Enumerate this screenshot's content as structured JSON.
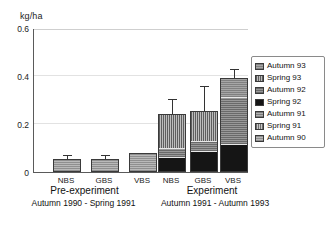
{
  "axis": {
    "y_unit": "kg/ha",
    "y_ticks": [
      "0.6",
      "0.4",
      "0.2",
      "0"
    ]
  },
  "groups": [
    {
      "name": "Pre-experiment",
      "title": "Pre-experiment",
      "subtitle": "Autumn 1990 - Spring 1991",
      "ticks": [
        "NBS",
        "GBS",
        "VBS"
      ]
    },
    {
      "name": "Experiment",
      "title": "Experiment",
      "subtitle": "Autumn 1991 - Autumn 1993",
      "ticks": [
        "NBS",
        "GBS",
        "VBS"
      ]
    }
  ],
  "legend": {
    "items": [
      {
        "label": "Autumn 93",
        "key": "a93",
        "swatch": "p-a93"
      },
      {
        "label": "Spring 93",
        "key": "s93",
        "swatch": "p-s93"
      },
      {
        "label": "Autumn 92",
        "key": "a92",
        "swatch": "p-a92"
      },
      {
        "label": "Spring 92",
        "key": "s92",
        "swatch": "p-s92"
      },
      {
        "label": "Autumn 91",
        "key": "a91",
        "swatch": "p-a91"
      },
      {
        "label": "Spring 91",
        "key": "s91",
        "swatch": "p-s91"
      },
      {
        "label": "Autumn 90",
        "key": "a90",
        "swatch": "p-a90"
      }
    ]
  },
  "chart_data": {
    "type": "bar",
    "stacked": true,
    "title": "",
    "xlabel": "",
    "ylabel": "kg/ha",
    "ylim": [
      0,
      0.6
    ],
    "yticks": [
      0,
      0.2,
      0.4,
      0.6
    ],
    "grid": "horizontal",
    "legend_position": "right",
    "categories": [
      "Pre-experiment NBS",
      "Pre-experiment GBS",
      "Pre-experiment VBS",
      "Experiment NBS",
      "Experiment GBS",
      "Experiment VBS"
    ],
    "series": [
      {
        "name": "Autumn 90",
        "values": [
          0.055,
          0.055,
          0.08,
          0,
          0,
          0
        ]
      },
      {
        "name": "Spring 91",
        "values": [
          0,
          0,
          0,
          0,
          0,
          0
        ]
      },
      {
        "name": "Autumn 91",
        "values": [
          0,
          0,
          0,
          0,
          0,
          0
        ]
      },
      {
        "name": "Spring 92",
        "values": [
          0,
          0,
          0,
          0.055,
          0.08,
          0.11
        ]
      },
      {
        "name": "Autumn 92",
        "values": [
          0,
          0,
          0,
          0.04,
          0.045,
          0.2
        ]
      },
      {
        "name": "Spring 93",
        "values": [
          0,
          0,
          0,
          0.145,
          0.13,
          0.0
        ]
      },
      {
        "name": "Autumn 93",
        "values": [
          0,
          0,
          0,
          0.0,
          0.0,
          0.08
        ]
      }
    ],
    "totals": [
      0.055,
      0.055,
      0.08,
      0.24,
      0.255,
      0.39
    ],
    "error_bar_tops": [
      0.065,
      0.065,
      0.08,
      0.3,
      0.355,
      0.425
    ],
    "units": "kg/ha"
  },
  "bars": [
    {
      "name": "pre-nbs",
      "left": 19,
      "err_top": 0.065,
      "segments": [
        {
          "key": "a90",
          "swatch": "p-a90",
          "value": 0.055
        }
      ]
    },
    {
      "name": "pre-gbs",
      "left": 57,
      "err_top": 0.065,
      "segments": [
        {
          "key": "a90",
          "swatch": "p-a90",
          "value": 0.055
        }
      ]
    },
    {
      "name": "pre-vbs",
      "left": 95,
      "err_top": 0.08,
      "segments": [
        {
          "key": "a90",
          "swatch": "p-a90",
          "value": 0.08
        }
      ]
    },
    {
      "name": "exp-nbs",
      "left": 124,
      "err_top": 0.3,
      "segments": [
        {
          "key": "s92",
          "swatch": "p-s92",
          "value": 0.055
        },
        {
          "key": "a92",
          "swatch": "p-a92",
          "value": 0.04
        },
        {
          "key": "s93",
          "swatch": "p-s93",
          "value": 0.145
        }
      ]
    },
    {
      "name": "exp-gbs",
      "left": 156,
      "err_top": 0.355,
      "segments": [
        {
          "key": "s92",
          "swatch": "p-s92",
          "value": 0.08
        },
        {
          "key": "a92",
          "swatch": "p-a92",
          "value": 0.045
        },
        {
          "key": "s93",
          "swatch": "p-s93",
          "value": 0.13
        }
      ]
    },
    {
      "name": "exp-vbs",
      "left": 186,
      "err_top": 0.425,
      "segments": [
        {
          "key": "s92",
          "swatch": "p-s92",
          "value": 0.11
        },
        {
          "key": "a92",
          "swatch": "p-a92",
          "value": 0.2
        },
        {
          "key": "a93",
          "swatch": "p-a93",
          "value": 0.08
        }
      ]
    }
  ],
  "xtick_positions": [
    19,
    57,
    95,
    124,
    156,
    186
  ]
}
